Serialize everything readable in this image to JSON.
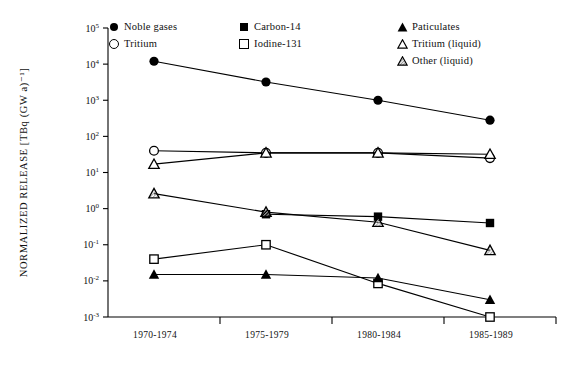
{
  "chart_data": {
    "type": "line",
    "title": "",
    "xlabel": "",
    "ylabel": "NORMALIZED RELEASE [TBq (GW a)⁻¹]",
    "categories": [
      "1970-1974",
      "1975-1979",
      "1980-1984",
      "1985-1989"
    ],
    "yscale": "log",
    "ylim": [
      0.001,
      100000
    ],
    "ytick_labels": [
      "10⁵",
      "10⁴",
      "10³",
      "10²",
      "10¹",
      "10⁰",
      "10⁻¹",
      "10⁻²",
      "10⁻³"
    ],
    "ytick_values": [
      100000,
      10000,
      1000,
      100,
      10,
      1,
      0.1,
      0.01,
      0.001
    ],
    "grid": false,
    "legend_position": "top",
    "series": [
      {
        "name": "Noble gases",
        "marker": "circle-filled",
        "values": [
          12000,
          3200,
          1000,
          280
        ]
      },
      {
        "name": "Tritium",
        "marker": "circle-open",
        "values": [
          40,
          35,
          35,
          25
        ]
      },
      {
        "name": "Carbon-14",
        "marker": "square-filled",
        "values": [
          null,
          0.7,
          0.6,
          0.4
        ]
      },
      {
        "name": "Iodine-131",
        "marker": "square-open",
        "values": [
          0.04,
          0.1,
          0.0085,
          0.001
        ]
      },
      {
        "name": "Paticulates",
        "marker": "triangle-filled",
        "values": [
          0.015,
          0.015,
          0.012,
          0.003
        ]
      },
      {
        "name": "Tritium (liquid)",
        "marker": "triangle-open",
        "values": [
          17,
          35,
          35,
          32
        ]
      },
      {
        "name": "Other (liquid)",
        "marker": "triangle-hatch",
        "values": [
          2.6,
          0.8,
          0.42,
          0.07
        ]
      }
    ]
  },
  "legend": {
    "columns": [
      {
        "entries": [
          {
            "label": "Noble  gases",
            "marker": "circle-filled"
          },
          {
            "label": "Tritium",
            "marker": "circle-open"
          }
        ]
      },
      {
        "entries": [
          {
            "label": "Carbon-14",
            "marker": "square-filled"
          },
          {
            "label": "Iodine-131",
            "marker": "square-open"
          }
        ]
      },
      {
        "entries": [
          {
            "label": "Paticulates",
            "marker": "triangle-filled"
          },
          {
            "label": "Tritium  (liquid)",
            "marker": "triangle-open"
          },
          {
            "label": "Other  (liquid)",
            "marker": "triangle-hatch"
          }
        ]
      }
    ]
  },
  "colors": {
    "line": "#000000",
    "axis": "#000000",
    "background": "#ffffff",
    "marker_fill_open": "#ffffff",
    "marker_hatch": "#b9b9b9"
  }
}
